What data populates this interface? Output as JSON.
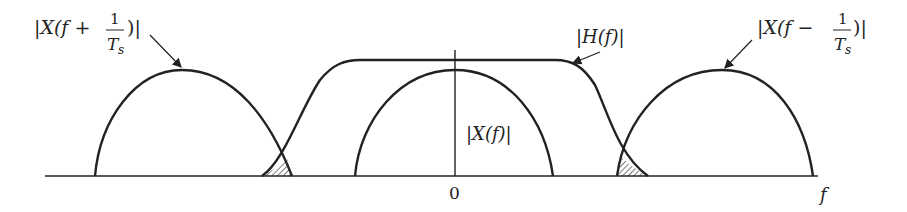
{
  "figure": {
    "labels": {
      "left_replica": {
        "prefix": "|X(f +",
        "frac_num": "1",
        "frac_den": "T",
        "frac_sub": "s",
        "suffix": ")|"
      },
      "right_replica": {
        "prefix": "|X(f −",
        "frac_num": "1",
        "frac_den": "T",
        "frac_sub": "s",
        "suffix": ")|"
      },
      "filter": "|H(f)|",
      "baseband": "|X(f)|",
      "origin": "0",
      "axis": "f"
    },
    "colors": {
      "stroke": "#222222",
      "background": "#ffffff"
    }
  }
}
